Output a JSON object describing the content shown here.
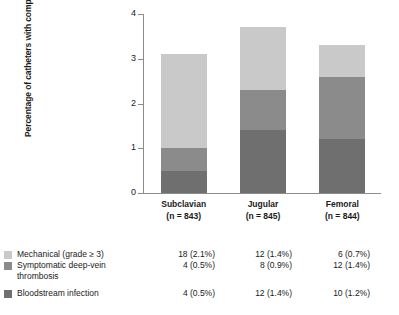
{
  "chart_data": {
    "type": "bar",
    "subtype": "stacked-bar",
    "title": "",
    "xlabel": "",
    "ylabel": "Percentage of catheters with complication",
    "ylim": [
      0,
      4
    ],
    "yticks": [
      "0",
      "1",
      "2",
      "3",
      "4"
    ],
    "grid": false,
    "legend_position": "bottom",
    "categories": [
      "Subclavian",
      "Jugular",
      "Femoral"
    ],
    "category_sublabels": [
      "(n = 843)",
      "(n = 845)",
      "(n = 844)"
    ],
    "series": [
      {
        "name": "Mechanical (grade ≥ 3)",
        "color": "#c9c9c9",
        "values": [
          2.1,
          1.4,
          0.7
        ],
        "counts": [
          18,
          12,
          6
        ],
        "cells": [
          "18 (2.1%)",
          "12 (1.4%)",
          "6 (0.7%)"
        ]
      },
      {
        "name": "Symptomatic deep-vein thrombosis",
        "name_line1": "Symptomatic deep-vein",
        "name_line2": "thrombosis",
        "color": "#8b8b8b",
        "values": [
          0.5,
          0.9,
          1.4
        ],
        "counts": [
          4,
          8,
          12
        ],
        "cells": [
          "4 (0.5%)",
          "8 (0.9%)",
          "12 (1.4%)"
        ]
      },
      {
        "name": "Bloodstream infection",
        "color": "#6f6f6f",
        "values": [
          0.5,
          1.4,
          1.2
        ],
        "counts": [
          4,
          12,
          10
        ],
        "cells": [
          "4 (0.5%)",
          "12 (1.4%)",
          "10 (1.2%)"
        ]
      }
    ],
    "totals": [
      3.1,
      3.7,
      3.3
    ]
  }
}
